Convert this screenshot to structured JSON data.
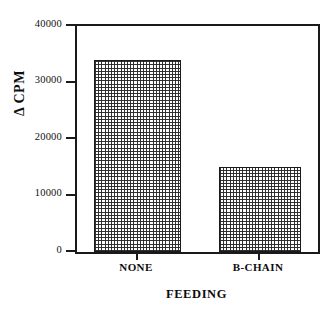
{
  "chart_data": {
    "type": "bar",
    "title": "",
    "xlabel": "FEEDING",
    "ylabel": "Δ CPM",
    "categories": [
      "NONE",
      "B-CHAIN"
    ],
    "values": [
      34000,
      15000
    ],
    "ylim": [
      0,
      40000
    ],
    "ytick_labels": [
      "0",
      "10000",
      "20000",
      "30000",
      "40000"
    ],
    "ytick_values": [
      0,
      10000,
      20000,
      30000,
      40000
    ],
    "grid": false,
    "legend": false,
    "bar_fill": "checkered-dot-pattern",
    "bar_edge_color": "#1a1a1a",
    "axis_color": "#1a1a1a",
    "background_color": "#ffffff"
  },
  "axes": {
    "y_ticks": [
      {
        "label": "40000",
        "value": 40000
      },
      {
        "label": "30000",
        "value": 30000
      },
      {
        "label": "20000",
        "value": 20000
      },
      {
        "label": "10000",
        "value": 10000
      },
      {
        "label": "0",
        "value": 0
      }
    ],
    "x_ticks": [
      {
        "label": "NONE"
      },
      {
        "label": "B-CHAIN"
      }
    ]
  }
}
